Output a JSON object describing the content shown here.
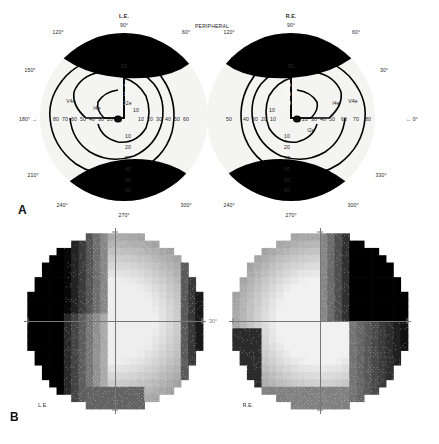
{
  "figure": {
    "panels": [
      {
        "letter": "A",
        "caption_label": "A"
      },
      {
        "letter": "B",
        "caption_label": "B"
      }
    ]
  },
  "panel_a": {
    "name": "goldmann-kinetic-perimetry",
    "center_title": "PERIPHERAL",
    "left_eye": {
      "eye_label": "L.E.",
      "apex_degree": "90°",
      "meridians": [
        "120°",
        "150°",
        "180°",
        "210°",
        "240°",
        "270°",
        "300°",
        "60°"
      ],
      "horizontal_arrow": "180° →",
      "horizontal_ticks": [
        "80",
        "70",
        "60",
        "50",
        "40",
        "30",
        "20",
        "10"
      ],
      "horizontal_ticks_inner": [
        "10",
        "20",
        "30",
        "40",
        "50",
        "60"
      ],
      "vertical_ticks_up": [
        "50",
        "40",
        "30",
        "20",
        "10"
      ],
      "vertical_ticks_down": [
        "10",
        "20",
        "30",
        "40",
        "50",
        "60"
      ],
      "isopters": [
        "V4e",
        "I4e",
        "I2e"
      ]
    },
    "right_eye": {
      "eye_label": "R.E.",
      "apex_degree": "90°",
      "meridians": [
        "120°",
        "60°",
        "30°",
        "330°",
        "300°",
        "270°",
        "240°"
      ],
      "horizontal_arrow": "← 0°",
      "horizontal_ticks": [
        "50",
        "40",
        "30",
        "20",
        "10"
      ],
      "horizontal_ticks_inner": [
        "10",
        "20",
        "30",
        "40",
        "50",
        "60",
        "70",
        "80"
      ],
      "vertical_ticks_up": [
        "50",
        "40",
        "30",
        "20",
        "10"
      ],
      "vertical_ticks_down": [
        "10",
        "20",
        "30",
        "40",
        "50",
        "60"
      ],
      "isopters": [
        "I4e",
        "V4e",
        "I2e"
      ]
    }
  },
  "panel_b": {
    "name": "static-perimetry-grayscale",
    "left_eye": {
      "eye_label": "L.E.",
      "axis_degree": "30°"
    },
    "right_eye": {
      "eye_label": "R.E.",
      "axis_degree": "30°"
    }
  },
  "chart_data": {
    "type": "heatmap",
    "xlabel": "Horizontal meridian (degrees)",
    "ylabel": "Vertical meridian (degrees)",
    "grid": false,
    "legend_position": "none",
    "panel_a": {
      "type": "line",
      "description": "Goldmann kinetic perimetry isopter plot, both eyes, showing dense loss",
      "xlim": [
        -90,
        90
      ],
      "ylim": [
        -70,
        60
      ],
      "series": [
        {
          "name": "V4e",
          "eye": "L.E.",
          "max_radius_deg": 62
        },
        {
          "name": "I4e",
          "eye": "L.E.",
          "max_radius_deg": 45
        },
        {
          "name": "I2e",
          "eye": "L.E.",
          "max_radius_deg": 26
        },
        {
          "name": "V4e",
          "eye": "R.E.",
          "max_radius_deg": 62
        },
        {
          "name": "I4e",
          "eye": "R.E.",
          "max_radius_deg": 45
        },
        {
          "name": "I2e",
          "eye": "R.E.",
          "max_radius_deg": 26
        }
      ],
      "filled_scotoma_color": "#000000",
      "background_color": "#f2f2f0"
    },
    "panel_b": {
      "type": "heatmap",
      "description": "Static threshold grayscale plots; dark = absolute defect, light = normal sensitivity",
      "grid_extent_deg": 30,
      "cells": 26,
      "grayscale_levels": [
        0,
        1,
        2,
        3,
        4,
        5,
        6,
        7,
        8,
        9
      ],
      "left_eye_defect_quadrants": [
        "superior-temporal-left",
        "inferior-temporal-left"
      ],
      "right_eye_defect_quadrants": [
        "superior-nasal-right"
      ]
    }
  }
}
